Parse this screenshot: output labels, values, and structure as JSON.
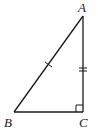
{
  "diagram": {
    "type": "right-triangle",
    "vertices": [
      {
        "label": "A",
        "x": 83,
        "y": 16
      },
      {
        "label": "B",
        "x": 14,
        "y": 112
      },
      {
        "label": "C",
        "x": 83,
        "y": 112
      }
    ],
    "labels": {
      "a": "A",
      "b": "B",
      "c": "C"
    },
    "right_angle_at": "C",
    "tick_marks": [
      {
        "segment": "AB",
        "count": 1
      },
      {
        "segment": "AC",
        "count": 2
      }
    ],
    "colors": {
      "stroke": "#1a1a1a",
      "background": "#ffffff"
    }
  }
}
